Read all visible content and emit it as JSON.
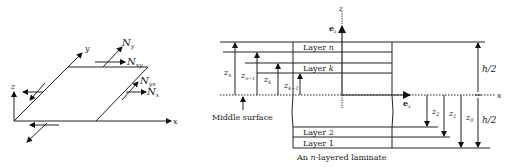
{
  "left_diagram": {
    "axes": {
      "x": "x",
      "y": "y",
      "z": "z"
    },
    "force_labels": {
      "Ny": {
        "base": "N",
        "sub": "y"
      },
      "Nxy": {
        "base": "N",
        "sub": "xy"
      },
      "Nyx": {
        "base": "N",
        "sub": "yx"
      },
      "Nx": {
        "base": "N",
        "sub": "x"
      }
    }
  },
  "right_diagram": {
    "axes": {
      "z": "z",
      "x": "x",
      "ez": {
        "base": "e",
        "sub": "z"
      },
      "ex": {
        "base": "e",
        "sub": "x"
      }
    },
    "layers": {
      "top": "Layer n",
      "k": "Layer k",
      "two": "Layer 2",
      "one": "Layer 1"
    },
    "left_dims": [
      {
        "base": "z",
        "sub": "n"
      },
      {
        "base": "z",
        "sub": "n−1"
      },
      {
        "base": "z",
        "sub": "k"
      },
      {
        "base": "z",
        "sub": "k−1"
      }
    ],
    "right_dims": [
      {
        "base": "z",
        "sub": "2"
      },
      {
        "base": "z",
        "sub": "1"
      },
      {
        "base": "z",
        "sub": "0"
      }
    ],
    "half_thickness_top": "h/2",
    "half_thickness_bottom": "h/2",
    "middle_surface_label": "Middle surface",
    "caption_prefix": "An ",
    "caption_n": "n",
    "caption_suffix": "-layered laminate"
  }
}
